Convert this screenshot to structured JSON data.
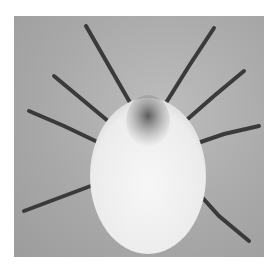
{
  "image": {
    "subject": "mite (microscope photograph)",
    "description": "Dorsal view of a pale, oval-bodied mite with eight dark segmented legs on a grey background",
    "colors": {
      "background": "#a9a9a9",
      "body": "#f2f2f2",
      "legs": "#3a3a3a",
      "gnathosoma": "#6a6a6a"
    }
  },
  "caption": {
    "text": ""
  }
}
